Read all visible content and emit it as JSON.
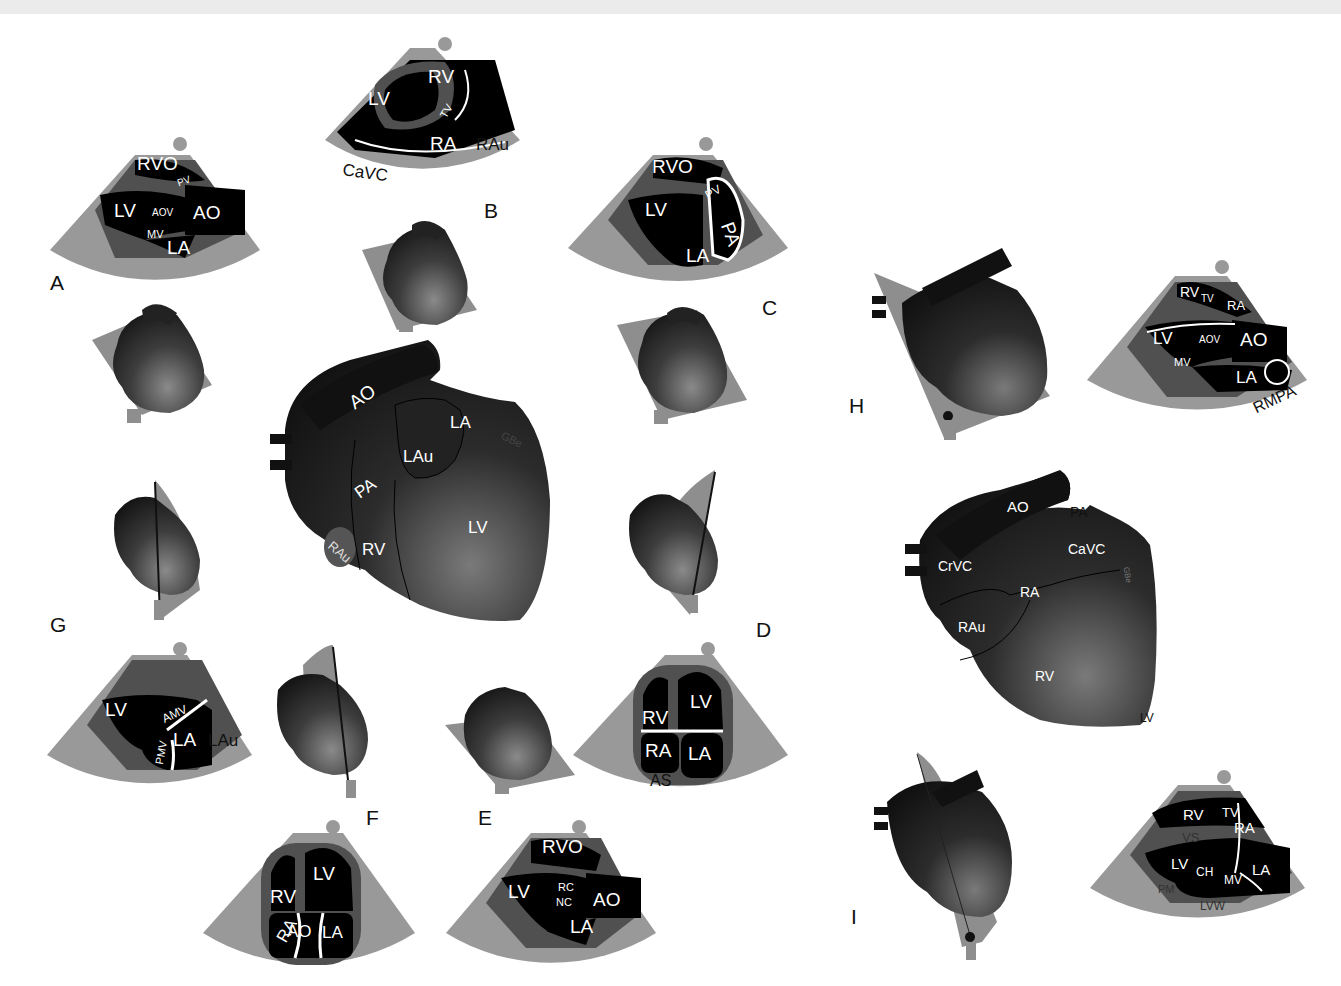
{
  "figure": {
    "colors": {
      "sector_gray": "#999999",
      "sector_dark": "#555555",
      "chamber": "#000000",
      "heart_dark": "#1a1a1a",
      "heart_light": "#6a6a6a",
      "plane_gray": "#8e8e8e",
      "background": "#ffffff"
    },
    "panel_letters": {
      "A": "A",
      "B": "B",
      "C": "C",
      "D": "D",
      "E": "E",
      "F": "F",
      "G": "G",
      "H": "H",
      "I": "I"
    },
    "center_heart_left": {
      "labels": {
        "ao": "AO",
        "la": "LA",
        "gbe": "GBe",
        "lau": "LAu",
        "pa": "PA",
        "lv": "LV",
        "rv": "RV",
        "rau": "RAu"
      }
    },
    "center_heart_right": {
      "labels": {
        "ao": "AO",
        "pa": "PA",
        "crvc": "CrVC",
        "cavc": "CaVC",
        "gbe": "GBe",
        "ra": "RA",
        "rau": "RAu",
        "rv": "RV",
        "lv": "LV"
      }
    },
    "echo_views": {
      "A": {
        "rvo": "RVO",
        "pv": "PV",
        "lv": "LV",
        "aov": "AOV",
        "ao": "AO",
        "mv": "MV",
        "la": "LA"
      },
      "B": {
        "rv": "RV",
        "lv": "LV",
        "tv": "TV",
        "ra": "RA",
        "rau": "RAu",
        "cavc": "CaVC"
      },
      "C": {
        "rvo": "RVO",
        "pv": "PV",
        "lv": "LV",
        "pa": "PA",
        "la": "LA"
      },
      "D": {
        "rv": "RV",
        "lv": "LV",
        "ra": "RA",
        "la": "LA",
        "as": "AS"
      },
      "E": {
        "rvo": "RVO",
        "lv": "LV",
        "rc": "RC",
        "nc": "NC",
        "ao": "AO",
        "la": "LA"
      },
      "F": {
        "rv": "RV",
        "lv": "LV",
        "ra": "RA",
        "ao": "AO",
        "la": "LA"
      },
      "G": {
        "lv": "LV",
        "amv": "AMV",
        "pmv": "PMV",
        "la": "LA",
        "lau": "LAu"
      },
      "H": {
        "rv": "RV",
        "tv": "TV",
        "ra": "RA",
        "lv": "LV",
        "aov": "AOV",
        "ao": "AO",
        "mv": "MV",
        "la": "LA",
        "rmpa": "RMPA"
      },
      "I": {
        "rv": "RV",
        "tv": "TV",
        "ra": "RA",
        "vs": "VS",
        "lv": "LV",
        "ch": "CH",
        "mv": "MV",
        "la": "LA",
        "pm": "PM",
        "lvw": "LVW"
      }
    }
  }
}
